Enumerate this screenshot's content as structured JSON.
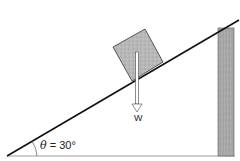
{
  "diagram": {
    "angle_symbol": "θ",
    "angle_equals": " = ",
    "angle_value": "30°",
    "force_label": "W",
    "colors": {
      "line": "#111111",
      "block_fill": "#b5b5b5",
      "post_fill": "#a8a8a8",
      "arrow_fill": "#ffffff",
      "ground": "#888888"
    }
  }
}
